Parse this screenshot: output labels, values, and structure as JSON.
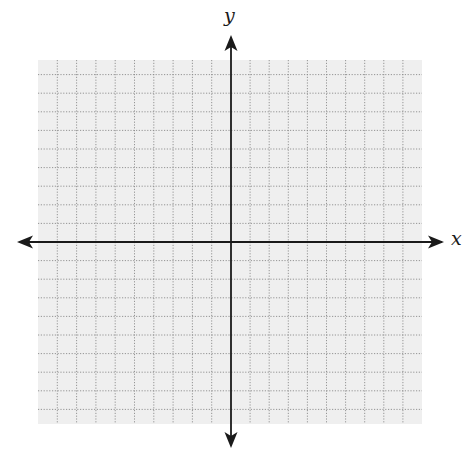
{
  "diagram": {
    "type": "coordinate-plane",
    "axes": {
      "x_label": "x",
      "y_label": "y",
      "color": "#1a1a1a",
      "arrows": [
        "left",
        "right",
        "up",
        "down"
      ]
    },
    "grid": {
      "background": "#efefef",
      "line_color": "#8a8a8a",
      "line_style": "dotted",
      "columns_left_of_y_axis": 10,
      "columns_right_of_y_axis": 10,
      "rows_above_x_axis": 9,
      "rows_below_x_axis": 9
    },
    "tick_labels": []
  }
}
